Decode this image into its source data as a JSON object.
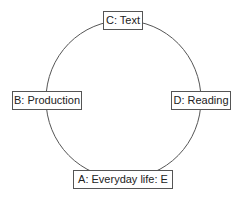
{
  "diagram": {
    "type": "cycle",
    "nodes": [
      {
        "id": "C",
        "label": "C: Text"
      },
      {
        "id": "B",
        "label": "B: Production"
      },
      {
        "id": "D",
        "label": "D: Reading"
      },
      {
        "id": "A",
        "label": "A: Everyday life: E"
      }
    ],
    "colors": {
      "line": "#555555",
      "background": "#ffffff",
      "text": "#222222"
    }
  }
}
